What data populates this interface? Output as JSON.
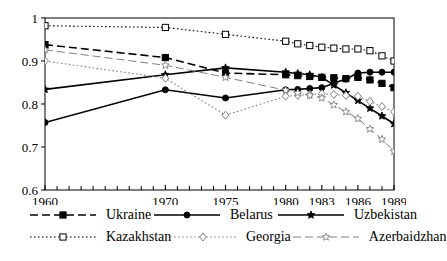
{
  "chart_data": {
    "type": "line",
    "title": "",
    "subtitle": "",
    "xlabel": "",
    "ylabel": "",
    "xlim": [
      1960,
      1989
    ],
    "ylim": [
      0.6,
      1.0
    ],
    "grid": false,
    "legend_position": "bottom",
    "y_ticks": [
      "0.6",
      "0.7",
      "0.8",
      "0.9",
      "1"
    ],
    "y_tick_values": [
      0.6,
      0.7,
      0.8,
      0.9,
      1.0
    ],
    "x_ticks": [
      "1960",
      "1970",
      "1975",
      "1980",
      "1983",
      "1986",
      "1989"
    ],
    "x_tick_values": [
      1960,
      1970,
      1975,
      1980,
      1983,
      1986,
      1989
    ],
    "x_minor_ticks": [
      1961,
      1962,
      1963,
      1964,
      1965,
      1966,
      1967,
      1968,
      1969,
      1971,
      1972,
      1973,
      1974,
      1976,
      1977,
      1978,
      1979,
      1981,
      1982,
      1984,
      1985,
      1987,
      1988
    ],
    "series": [
      {
        "name": "Ukraine",
        "color": "#000000",
        "marker": "filled-square",
        "dash": "dashed",
        "x": [
          1960,
          1970,
          1975,
          1980,
          1981,
          1982,
          1983,
          1984,
          1985,
          1986,
          1987,
          1988,
          1989
        ],
        "values": [
          0.938,
          0.908,
          0.872,
          0.868,
          0.866,
          0.864,
          0.862,
          0.861,
          0.859,
          0.862,
          0.856,
          0.848,
          0.838
        ]
      },
      {
        "name": "Belarus",
        "color": "#000000",
        "marker": "filled-circle",
        "dash": "solid",
        "x": [
          1960,
          1970,
          1975,
          1980,
          1981,
          1982,
          1983,
          1984,
          1985,
          1986,
          1987,
          1988,
          1989
        ],
        "values": [
          0.757,
          0.833,
          0.814,
          0.833,
          0.834,
          0.836,
          0.838,
          0.848,
          0.858,
          0.872,
          0.874,
          0.874,
          0.874
        ]
      },
      {
        "name": "Uzbekistan",
        "color": "#000000",
        "marker": "star-filled",
        "dash": "solid",
        "x": [
          1960,
          1970,
          1975,
          1980,
          1981,
          1982,
          1983,
          1984,
          1985,
          1986,
          1987,
          1988,
          1989
        ],
        "values": [
          0.834,
          0.868,
          0.884,
          0.874,
          0.871,
          0.868,
          0.862,
          0.844,
          0.826,
          0.808,
          0.79,
          0.772,
          0.754
        ]
      },
      {
        "name": "Kazakhstan",
        "color": "#000000",
        "marker": "open-square",
        "dash": "dotted",
        "x": [
          1960,
          1970,
          1975,
          1980,
          1981,
          1982,
          1983,
          1984,
          1985,
          1986,
          1987,
          1988,
          1989
        ],
        "values": [
          0.982,
          0.978,
          0.962,
          0.946,
          0.94,
          0.936,
          0.932,
          0.93,
          0.928,
          0.928,
          0.924,
          0.912,
          0.9
        ]
      },
      {
        "name": "Georgia",
        "color": "#808080",
        "marker": "open-diamond",
        "dash": "dotted",
        "x": [
          1960,
          1970,
          1975,
          1980,
          1981,
          1982,
          1983,
          1984,
          1985,
          1986,
          1987,
          1988,
          1989
        ],
        "values": [
          0.9,
          0.86,
          0.774,
          0.818,
          0.82,
          0.822,
          0.824,
          0.822,
          0.82,
          0.818,
          0.806,
          0.794,
          0.782
        ]
      },
      {
        "name": "Azerbaidzhan",
        "color": "#808080",
        "marker": "open-star",
        "dash": "dashed",
        "x": [
          1960,
          1970,
          1975,
          1980,
          1981,
          1982,
          1983,
          1984,
          1985,
          1986,
          1987,
          1988,
          1989
        ],
        "values": [
          0.926,
          0.89,
          0.862,
          0.832,
          0.826,
          0.82,
          0.814,
          0.798,
          0.782,
          0.766,
          0.742,
          0.718,
          0.69
        ]
      }
    ]
  },
  "legend": {
    "entries": [
      {
        "label": "Ukraine"
      },
      {
        "label": "Belarus"
      },
      {
        "label": "Uzbekistan"
      },
      {
        "label": "Kazakhstan"
      },
      {
        "label": "Georgia"
      },
      {
        "label": "Azerbaidzhan"
      }
    ]
  }
}
